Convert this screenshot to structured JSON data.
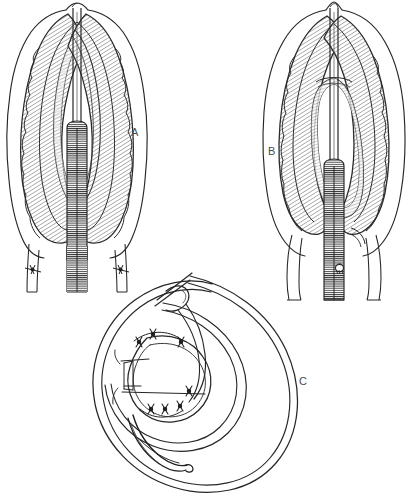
{
  "figure": {
    "type": "scientific-line-illustration",
    "background_color": "#ffffff",
    "ink_color": "#1a1a1a",
    "hatch_color": "#555555",
    "label_color": "#4a4a4a",
    "width_px": 406,
    "height_px": 494
  },
  "panels": [
    {
      "id": "A",
      "label": "A",
      "label_x": 131,
      "label_y": 127,
      "description": "Anterior end, lateral view: head with paired wavy cuticular ridges flanking a central hatched esophageal shaft",
      "bounds": {
        "x": 10,
        "y": 4,
        "width": 130,
        "height": 275
      }
    },
    {
      "id": "B",
      "label": "B",
      "label_x": 268,
      "label_y": 146,
      "description": "Anterior end, second view: broader head with inner looped structure around a central hatched esophageal shaft",
      "bounds": {
        "x": 275,
        "y": 4,
        "width": 128,
        "height": 285
      }
    },
    {
      "id": "C",
      "label": "C",
      "label_x": 299,
      "label_y": 376,
      "description": "Coiled posterior end of male: spiral body with spicules, bursal rays and ventral papillae",
      "bounds": {
        "x": 62,
        "y": 270,
        "width": 250,
        "height": 220
      }
    }
  ]
}
